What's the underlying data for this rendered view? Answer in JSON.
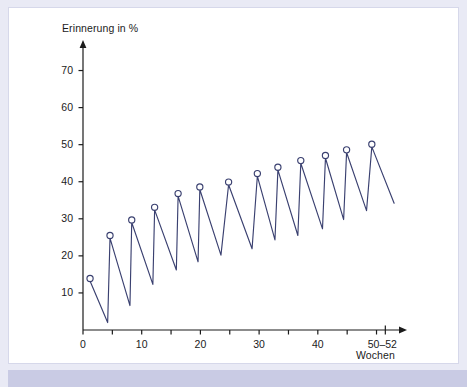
{
  "figure": {
    "frame_color": "#e9eaf5",
    "band_color": "#c9cbe4",
    "plot_bg": "#ffffff",
    "series_color": "#3a4070",
    "axis_color": "#1b1b1b"
  },
  "chart_data": {
    "type": "line",
    "title": "",
    "subtitle": "",
    "xlabel": "Wochen",
    "ylabel": "Erinnerung in %",
    "xlim": [
      0,
      54
    ],
    "ylim": [
      0,
      75
    ],
    "grid": false,
    "legend": null,
    "annotations": [],
    "yticks": [
      10,
      20,
      30,
      40,
      50,
      60,
      70
    ],
    "ytick_labels": [
      "10",
      "20",
      "30",
      "40",
      "50",
      "60",
      "70"
    ],
    "xticks": [
      0,
      5,
      10,
      15,
      20,
      25,
      30,
      35,
      40,
      45,
      50
    ],
    "xtick_labels_shown": [
      {
        "value": 0,
        "label": "0"
      },
      {
        "value": 10,
        "label": "10"
      },
      {
        "value": 20,
        "label": "20"
      },
      {
        "value": 30,
        "label": "30"
      },
      {
        "value": 40,
        "label": "40"
      },
      {
        "value": 51,
        "label": "50–52"
      }
    ],
    "marker": "open-circle",
    "marker_on": "peaks",
    "series": [
      {
        "name": "Erinnerung",
        "color": "#3a4070",
        "points": [
          {
            "x": 1.2,
            "y": 13.2,
            "marker": true
          },
          {
            "x": 4.2,
            "y": 2.0,
            "marker": false
          },
          {
            "x": 4.6,
            "y": 24.8,
            "marker": true
          },
          {
            "x": 8.0,
            "y": 6.6,
            "marker": false
          },
          {
            "x": 8.3,
            "y": 29.0,
            "marker": true
          },
          {
            "x": 11.9,
            "y": 12.3,
            "marker": false
          },
          {
            "x": 12.2,
            "y": 32.4,
            "marker": true
          },
          {
            "x": 15.9,
            "y": 16.2,
            "marker": false
          },
          {
            "x": 16.2,
            "y": 36.1,
            "marker": true
          },
          {
            "x": 19.6,
            "y": 18.4,
            "marker": false
          },
          {
            "x": 19.9,
            "y": 37.9,
            "marker": true
          },
          {
            "x": 23.5,
            "y": 20.2,
            "marker": false
          },
          {
            "x": 24.8,
            "y": 39.2,
            "marker": true
          },
          {
            "x": 28.8,
            "y": 21.9,
            "marker": false
          },
          {
            "x": 29.7,
            "y": 41.5,
            "marker": true
          },
          {
            "x": 32.7,
            "y": 24.3,
            "marker": false
          },
          {
            "x": 33.2,
            "y": 43.2,
            "marker": true
          },
          {
            "x": 36.6,
            "y": 25.5,
            "marker": false
          },
          {
            "x": 37.1,
            "y": 45.0,
            "marker": true
          },
          {
            "x": 40.8,
            "y": 27.3,
            "marker": false
          },
          {
            "x": 41.3,
            "y": 46.4,
            "marker": true
          },
          {
            "x": 44.4,
            "y": 29.8,
            "marker": false
          },
          {
            "x": 44.9,
            "y": 47.9,
            "marker": true
          },
          {
            "x": 48.3,
            "y": 32.2,
            "marker": false
          },
          {
            "x": 49.2,
            "y": 49.4,
            "marker": true
          },
          {
            "x": 53.0,
            "y": 34.2,
            "marker": false
          }
        ]
      }
    ]
  }
}
